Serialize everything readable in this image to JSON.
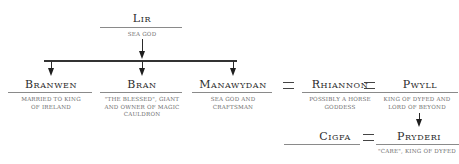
{
  "diagram": {
    "type": "family-tree",
    "root": {
      "name": "Lir",
      "description": "Sea god"
    },
    "children": [
      {
        "name": "Branwen",
        "description": "Married to King of Ireland"
      },
      {
        "name": "Bran",
        "description": "\"The Blessed\", giant and owner of magic cauldron"
      },
      {
        "name": "Manawydan",
        "description": "Sea god and craftsman"
      }
    ],
    "spouses": [
      {
        "name": "Rhiannon",
        "description": "Possibly a horse goddess"
      },
      {
        "name": "Pwyll",
        "description": "King of Dyfed and lord of Beyond"
      }
    ],
    "next_generation": [
      {
        "name": "Cigfa",
        "description": ""
      },
      {
        "name": "Pryderi",
        "description": "\"Care\", King of Dyfed"
      }
    ],
    "marriage_symbol": "="
  },
  "labels": {
    "lir_name": "Lir",
    "lir_desc": "Sea god",
    "branwen_name": "Branwen",
    "branwen_desc_1": "Married to King",
    "branwen_desc_2": "of Ireland",
    "bran_name": "Bran",
    "bran_desc_1": "\"The Blessed\", giant",
    "bran_desc_2": "and owner of magic",
    "bran_desc_3": "cauldron",
    "manawydan_name": "Manawydan",
    "manawydan_desc_1": "Sea god and",
    "manawydan_desc_2": "craftsman",
    "rhiannon_name": "Rhiannon",
    "rhiannon_desc_1": "Possibly a horse",
    "rhiannon_desc_2": "goddess",
    "pwyll_name": "Pwyll",
    "pwyll_desc_1": "King of Dyfed and",
    "pwyll_desc_2": "lord of Beyond",
    "cigfa_name": "Cigfa",
    "pryderi_name": "Pryderi",
    "pryderi_desc_1": "\"Care\", King of Dyfed",
    "eq_1": "=",
    "eq_2": "=",
    "eq_3": "="
  },
  "colors": {
    "text_name": "#2b2b2b",
    "text_desc": "#6d6d6d",
    "lines": "#333333",
    "underline": "#8a8a8a"
  }
}
